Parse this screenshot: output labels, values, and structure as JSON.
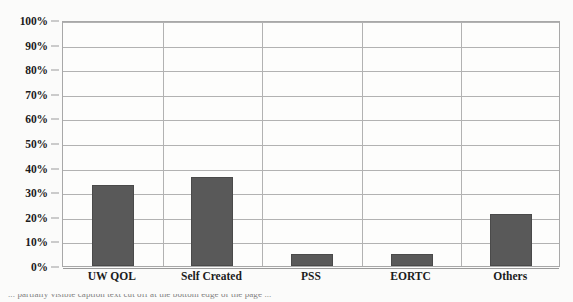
{
  "chart_data": {
    "type": "bar",
    "title": "",
    "xlabel": "",
    "ylabel": "",
    "categories": [
      "UW QOL",
      "Self Created",
      "PSS",
      "EORTC",
      "Others"
    ],
    "values": [
      33,
      36,
      5,
      5,
      21
    ],
    "value_labels": [
      "33%",
      "36%",
      "5%",
      "5%",
      "21%"
    ],
    "ylim": [
      0,
      100
    ],
    "ytick_labels": [
      "100%",
      "90%",
      "80%",
      "70%",
      "60%",
      "50%",
      "40%",
      "30%",
      "20%",
      "10%",
      "0%"
    ],
    "ytick_values": [
      100,
      90,
      80,
      70,
      60,
      50,
      40,
      30,
      20,
      10,
      0
    ],
    "grid": "horizontal-and-category-separators",
    "legend": "none",
    "series": [
      {
        "name": "Proportion of studies",
        "values": [
          33,
          36,
          5,
          5,
          21
        ]
      }
    ],
    "colors": {
      "bar_fill": "#595959",
      "bar_edge": "#4a4a4a",
      "gridline": "#b2b2b2",
      "plot_border": "#a8a8a8",
      "plot_background": "#fdfdfc",
      "page_background": "#fbfbfa",
      "tick_text": "#1c1c1c"
    }
  },
  "caption": {
    "cutoff_line": "... partially visible caption text cut off at the bottom edge of the page ..."
  }
}
